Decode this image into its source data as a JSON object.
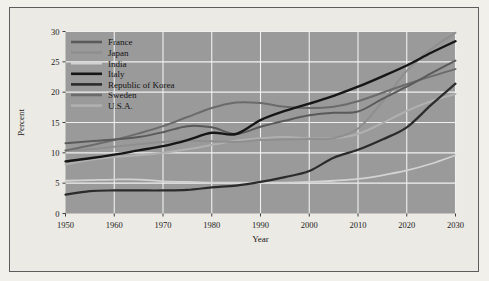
{
  "figure": {
    "background_color": "#f2f0ea",
    "panel_color": "#eceae4",
    "frame_color": "#5d5d5d",
    "plot_background_color": "#9a9a9a",
    "gridline_color": "#f0f0f0"
  },
  "chart_data": {
    "type": "line",
    "title": "",
    "xlabel": "Year",
    "ylabel": "Percent",
    "xlim": [
      1950,
      2030
    ],
    "ylim": [
      0,
      30
    ],
    "xticks": [
      1950,
      1960,
      1970,
      1980,
      1990,
      2000,
      2010,
      2020,
      2030
    ],
    "xtick_labels": [
      "1950",
      "1960",
      "1970",
      "1980",
      "1990",
      "2000",
      "2010",
      "2020",
      "2030"
    ],
    "yticks": [
      0,
      5,
      10,
      15,
      20,
      25,
      30
    ],
    "ytick_labels": [
      "0",
      "5",
      "10",
      "15",
      "20",
      "25",
      "30"
    ],
    "grid": true,
    "legend_position": "upper left",
    "x": [
      1950,
      1955,
      1960,
      1965,
      1970,
      1975,
      1980,
      1985,
      1990,
      1995,
      2000,
      2005,
      2010,
      2015,
      2020,
      2025,
      2030
    ],
    "series": [
      {
        "name": "France",
        "color": "#5a5a5a",
        "width": 2.0,
        "values": [
          11.6,
          11.9,
          12.2,
          12.6,
          13.4,
          14.4,
          14.2,
          13.1,
          14.3,
          15.3,
          16.2,
          16.6,
          16.8,
          18.9,
          20.9,
          23.1,
          25.2
        ]
      },
      {
        "name": "Japan",
        "color": "#8f8f8f",
        "width": 2.0,
        "values": [
          10.4,
          10.6,
          11.0,
          11.4,
          11.8,
          12.0,
          11.9,
          11.8,
          12.1,
          12.2,
          12.3,
          12.4,
          14.0,
          18.4,
          23.5,
          27.1,
          29.8
        ]
      },
      {
        "name": "India",
        "color": "#d3d3d3",
        "width": 1.8,
        "values": [
          5.4,
          5.5,
          5.6,
          5.6,
          5.3,
          5.2,
          5.1,
          5.1,
          5.1,
          5.1,
          5.2,
          5.4,
          5.7,
          6.3,
          7.1,
          8.2,
          9.6
        ]
      },
      {
        "name": "Italy",
        "color": "#161616",
        "width": 2.4,
        "values": [
          8.6,
          9.1,
          9.7,
          10.4,
          11.1,
          12.1,
          13.3,
          13.1,
          15.4,
          16.9,
          18.1,
          19.4,
          20.9,
          22.6,
          24.4,
          26.5,
          28.4
        ]
      },
      {
        "name": "Republic of Korea",
        "color": "#2b2b2b",
        "width": 2.2,
        "values": [
          3.1,
          3.7,
          3.8,
          3.8,
          3.8,
          3.9,
          4.3,
          4.6,
          5.2,
          6.0,
          7.0,
          9.2,
          10.5,
          12.2,
          14.2,
          17.9,
          21.4
        ]
      },
      {
        "name": "Sweden",
        "color": "#6b6b6b",
        "width": 2.0,
        "values": [
          10.4,
          11.2,
          12.1,
          13.2,
          14.4,
          15.9,
          17.4,
          18.3,
          18.2,
          17.6,
          17.4,
          17.6,
          18.5,
          19.9,
          21.3,
          22.6,
          23.8
        ]
      },
      {
        "name": "U.S.A.",
        "color": "#b0b0b0",
        "width": 2.0,
        "values": [
          8.1,
          8.8,
          9.3,
          9.6,
          10.0,
          10.6,
          11.3,
          12.0,
          12.4,
          12.6,
          12.4,
          12.4,
          13.1,
          14.9,
          16.9,
          18.5,
          19.7
        ]
      }
    ]
  },
  "legend": {
    "items": [
      {
        "label": "France",
        "color": "#5a5a5a"
      },
      {
        "label": "Japan",
        "color": "#8f8f8f"
      },
      {
        "label": "India",
        "color": "#d3d3d3"
      },
      {
        "label": "Italy",
        "color": "#161616"
      },
      {
        "label": "Republic of Korea",
        "color": "#2b2b2b"
      },
      {
        "label": "Sweden",
        "color": "#6b6b6b"
      },
      {
        "label": "U.S.A.",
        "color": "#b0b0b0"
      }
    ]
  }
}
